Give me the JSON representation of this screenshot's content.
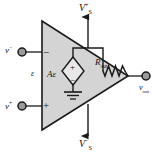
{
  "figure": {
    "diagram_type": "circuit-schematic",
    "colors": {
      "triangle_fill": "#d4d4d4",
      "stroke": "#1a1a1a",
      "background": "#ffffff",
      "terminal_fill": "#9a9a9a"
    }
  },
  "labels": {
    "supply_positive": {
      "base": "V",
      "sub": "S",
      "sup": "+"
    },
    "supply_negative": {
      "base": "V",
      "sub": "S",
      "sup": "−"
    },
    "input_inverting": {
      "base": "v",
      "sup": "−"
    },
    "input_noninverting": {
      "base": "v",
      "sup": "+"
    },
    "differential_input": "ε",
    "dependent_source": {
      "gain": "A",
      "variable": "ε"
    },
    "output_resistance": {
      "base": "R",
      "sub": "out"
    },
    "output_voltage": {
      "base": "v",
      "sub": "out"
    }
  },
  "polarity_marks": {
    "inverting_terminal": "−",
    "noninverting_terminal": "+",
    "source_top": "+",
    "source_bottom": "−"
  },
  "components": [
    {
      "name": "amplifier-triangle",
      "type": "op-amp-body"
    },
    {
      "name": "dependent-voltage-source",
      "type": "diamond-vcvs",
      "label": "Aε"
    },
    {
      "name": "output-resistor",
      "type": "resistor-zigzag",
      "label": "Rout"
    },
    {
      "name": "ground-symbol",
      "type": "ground"
    },
    {
      "name": "inverting-input-terminal",
      "type": "terminal-node"
    },
    {
      "name": "noninverting-input-terminal",
      "type": "terminal-node"
    },
    {
      "name": "output-terminal",
      "type": "terminal-node"
    },
    {
      "name": "positive-supply-arrow",
      "type": "arrow-up"
    },
    {
      "name": "negative-supply-arrow",
      "type": "arrow-down"
    }
  ]
}
